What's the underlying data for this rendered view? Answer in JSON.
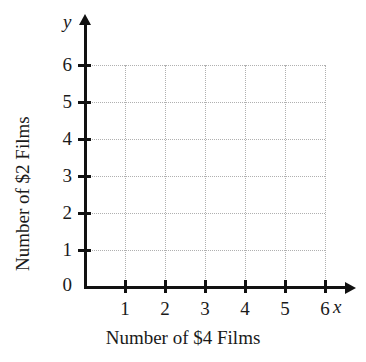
{
  "chart_data": {
    "type": "scatter",
    "title": "",
    "subtitle": "",
    "xlabel": "Number of $4 Films",
    "ylabel": "Number of $2 Films",
    "x_axis_variable": "x",
    "y_axis_variable": "y",
    "origin_label": "0",
    "xlim": [
      0,
      6
    ],
    "ylim": [
      0,
      6
    ],
    "x_ticks": [
      "1",
      "2",
      "3",
      "4",
      "5",
      "6"
    ],
    "y_ticks": [
      "1",
      "2",
      "3",
      "4",
      "5",
      "6"
    ],
    "x_tick_values": [
      1,
      2,
      3,
      4,
      5,
      6
    ],
    "y_tick_values": [
      1,
      2,
      3,
      4,
      5,
      6
    ],
    "grid": true,
    "grid_style": "dotted",
    "legend": null,
    "legend_position": "none",
    "series": [],
    "values": [],
    "annotations": [],
    "colors": {
      "axis": "#111111",
      "grid": "#b0b0b0",
      "text": "#1a1a1a",
      "background": "#ffffff"
    }
  },
  "layout": {
    "origin_x": 85,
    "origin_y": 287,
    "x_step": 40,
    "y_step": 37
  }
}
